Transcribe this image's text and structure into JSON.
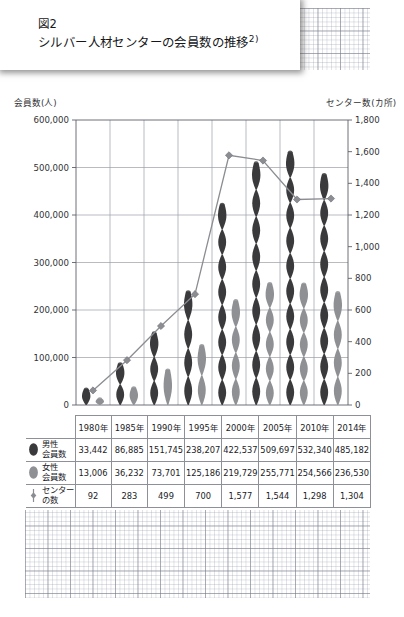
{
  "figure": {
    "number_label": "図2",
    "title": "シルバー人材センターの会員数の推移",
    "footnote_marker": "2)"
  },
  "axes": {
    "left_title": "会員数(人)",
    "right_title": "センター数(カ所)",
    "left_ticks": [
      "600,000",
      "500,000",
      "400,000",
      "300,000",
      "200,000",
      "100,000",
      "0"
    ],
    "right_ticks": [
      "1,800",
      "1,600",
      "1,400",
      "1,200",
      "1,000",
      "800",
      "600",
      "400",
      "200",
      "0"
    ]
  },
  "table": {
    "years": [
      "1980年",
      "1985年",
      "1990年",
      "1995年",
      "2000年",
      "2005年",
      "2010年",
      "2014年"
    ],
    "rows": [
      {
        "label_line1": "男性",
        "label_line2": "会員数",
        "icon": "dark-ellipse-marker",
        "values": [
          "33,442",
          "86,885",
          "151,745",
          "238,207",
          "422,537",
          "509,697",
          "532,340",
          "485,182"
        ]
      },
      {
        "label_line1": "女性",
        "label_line2": "会員数",
        "icon": "gray-ellipse-marker",
        "values": [
          "13,006",
          "36,232",
          "73,701",
          "125,186",
          "219,729",
          "255,771",
          "254,566",
          "236,530"
        ]
      },
      {
        "label_line1": "センター",
        "label_line2": "の数",
        "icon": "line-diamond-marker",
        "values": [
          "92",
          "283",
          "499",
          "700",
          "1,577",
          "1,544",
          "1,298",
          "1,304"
        ]
      }
    ]
  },
  "colors": {
    "male_bar": "#3a3a3c",
    "female_bar": "#8e9094",
    "line": "#8b8d92",
    "grid": "#9b9ea6",
    "frame": "#5d6068",
    "text": "#1b1c1f"
  },
  "chart_data": {
    "type": "bar",
    "title": "シルバー人材センターの会員数の推移",
    "xlabel": "",
    "ylabel": "会員数(人)",
    "y2label": "センター数(カ所)",
    "categories": [
      "1980年",
      "1985年",
      "1990年",
      "1995年",
      "2000年",
      "2005年",
      "2010年",
      "2014年"
    ],
    "ylim": [
      0,
      600000
    ],
    "y2lim": [
      0,
      1800
    ],
    "grid": true,
    "legend": "below-in-table",
    "series": [
      {
        "name": "男性会員数",
        "type": "bar",
        "axis": "left",
        "color": "#3a3a3c",
        "values": [
          33442,
          86885,
          151745,
          238207,
          422537,
          509697,
          532340,
          485182
        ]
      },
      {
        "name": "女性会員数",
        "type": "bar",
        "axis": "left",
        "color": "#8e9094",
        "values": [
          13006,
          36232,
          73701,
          125186,
          219729,
          255771,
          254566,
          236530
        ]
      },
      {
        "name": "センターの数",
        "type": "line",
        "axis": "right",
        "color": "#8b8d92",
        "marker": "diamond",
        "values": [
          92,
          283,
          499,
          700,
          1577,
          1544,
          1298,
          1304
        ]
      }
    ]
  }
}
